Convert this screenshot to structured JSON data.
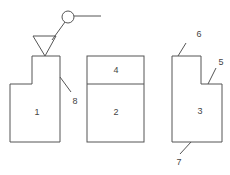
{
  "diagram": {
    "stroke_color": "#555555",
    "text_color": "#444444",
    "background": "#ffffff",
    "parts": [
      {
        "id": "1",
        "label": "1",
        "description": "stepped block, left"
      },
      {
        "id": "2",
        "label": "2",
        "description": "middle block, lower section"
      },
      {
        "id": "3",
        "label": "3",
        "description": "stepped block, right"
      },
      {
        "id": "4",
        "label": "4",
        "description": "middle block, upper section"
      }
    ],
    "callouts": [
      {
        "id": "5",
        "label": "5"
      },
      {
        "id": "6",
        "label": "6"
      },
      {
        "id": "7",
        "label": "7"
      },
      {
        "id": "8",
        "label": "8"
      }
    ],
    "symbols": [
      {
        "name": "triangle-marker"
      },
      {
        "name": "circle-marker"
      }
    ]
  }
}
